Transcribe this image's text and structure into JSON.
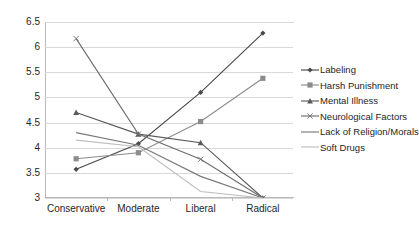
{
  "chart_data": {
    "type": "line",
    "title": "",
    "xlabel": "",
    "ylabel": "",
    "categories": [
      "Conservative",
      "Moderate",
      "Liberal",
      "Radical"
    ],
    "ylim": [
      3,
      6.5
    ],
    "yticks": [
      3,
      3.5,
      4,
      4.5,
      5,
      5.5,
      6,
      6.5
    ],
    "ytick_labels": [
      "3",
      "3.5",
      "4",
      "4.5",
      "5",
      "5.5",
      "6",
      "6.5"
    ],
    "grid": true,
    "legend_position": "right",
    "series": [
      {
        "name": "Labeling",
        "marker": "diamond",
        "color": "#4a4a4a",
        "values": [
          3.57,
          4.08,
          5.1,
          6.28
        ]
      },
      {
        "name": "Harsh Punishment",
        "marker": "square",
        "color": "#8c8c8c",
        "values": [
          3.78,
          3.9,
          4.52,
          5.38
        ]
      },
      {
        "name": "Mental Illness",
        "marker": "triangle",
        "color": "#595959",
        "values": [
          4.7,
          4.27,
          4.1,
          3.0
        ]
      },
      {
        "name": "Neurological Factors",
        "marker": "x",
        "color": "#6e6e6e",
        "values": [
          6.17,
          4.27,
          3.77,
          3.0
        ]
      },
      {
        "name": "Lack of Religion/Morals",
        "marker": "line",
        "color": "#7a7a7a",
        "values": [
          4.3,
          4.05,
          3.43,
          3.0
        ]
      },
      {
        "name": "Soft Drugs",
        "marker": "line",
        "color": "#bdbdbd",
        "values": [
          4.15,
          4.02,
          3.13,
          3.0
        ]
      }
    ]
  }
}
